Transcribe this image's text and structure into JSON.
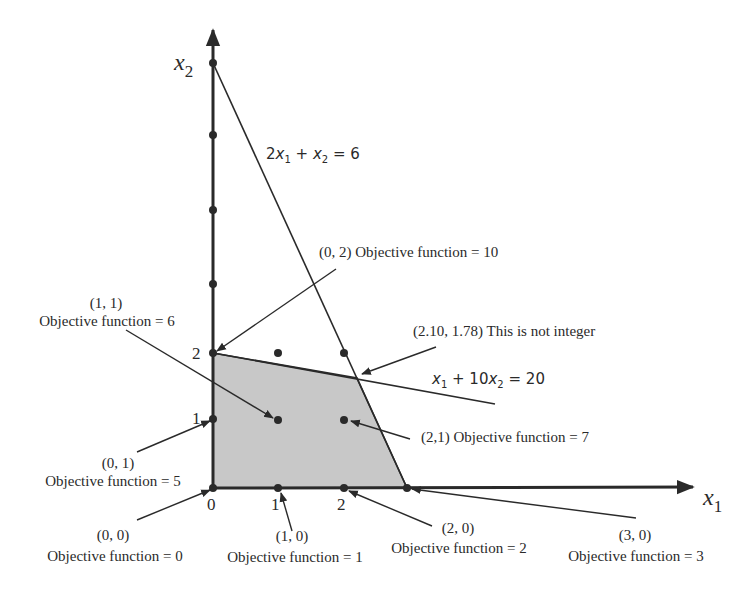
{
  "figure": {
    "axes": {
      "x_label": "x",
      "x_label_sub": "1",
      "y_label": "x",
      "y_label_sub": "2",
      "x_ticks": [
        "0",
        "1",
        "2"
      ],
      "y_ticks": [
        "1",
        "2"
      ]
    },
    "constraints": [
      {
        "id": "c1",
        "text_parts": [
          "2",
          "x",
          "1",
          " + ",
          "x",
          "2",
          " = 6"
        ],
        "label": "2x1 + x2 = 6"
      },
      {
        "id": "c2",
        "text_parts": [
          "x",
          "1",
          " + 10",
          "x",
          "2",
          " = 20"
        ],
        "label": "x1 + 10x2 = 20"
      }
    ],
    "annotations": {
      "p02": {
        "line1": "(0, 2) Objective function = 10"
      },
      "p11": {
        "line1": "(1, 1)",
        "line2": "Objective function = 6"
      },
      "lp_opt": {
        "line1": "(2.10, 1.78) This is not integer"
      },
      "p21": {
        "line1": "(2,1) Objective function = 7"
      },
      "p01": {
        "line1": "(0, 1)",
        "line2": "Objective function = 5"
      },
      "p00": {
        "line1": "(0, 0)",
        "line2": "Objective function = 0"
      },
      "p10": {
        "line1": "(1, 0)",
        "line2": "Objective function = 1"
      },
      "p20": {
        "line1": "(2, 0)",
        "line2": "Objective function = 2"
      },
      "p30": {
        "line1": "(3, 0)",
        "line2": "Objective function = 3"
      }
    },
    "colors": {
      "feasible_region": "#c8c8c8",
      "lines": "#2a2a2a",
      "background": "#ffffff"
    }
  }
}
